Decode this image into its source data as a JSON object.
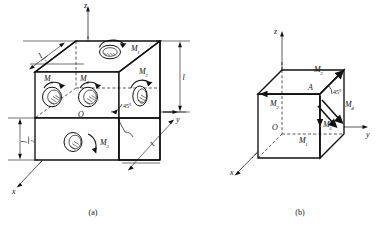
{
  "figure": {
    "panels": [
      {
        "id": "a",
        "caption": "(a)",
        "axes": {
          "x": "x",
          "y": "y",
          "z": "z",
          "origin": "O"
        },
        "angle_label": "45°",
        "dimensions": [
          {
            "name": "top-left-length",
            "text_numerator": "l",
            "text_denominator": "2"
          },
          {
            "name": "bottom-left-height",
            "text_numerator": "l",
            "text_denominator": "2"
          },
          {
            "name": "right-height",
            "text": "l"
          },
          {
            "name": "depth-length",
            "text": "l"
          }
        ],
        "moments": [
          {
            "label": "M",
            "sub": "1"
          },
          {
            "label": "M",
            "sub": "2"
          },
          {
            "label": "M",
            "sub": "3"
          },
          {
            "label": "M",
            "sub": "4"
          },
          {
            "label": "M",
            "sub": "5"
          }
        ]
      },
      {
        "id": "b",
        "caption": "(b)",
        "axes": {
          "x": "x",
          "y": "y",
          "z": "z",
          "origin": "O"
        },
        "point_label": "A",
        "angle_label": "45°",
        "moments": [
          {
            "label": "M",
            "sub": "1"
          },
          {
            "label": "M",
            "sub": "2"
          },
          {
            "label": "M",
            "sub": "3"
          },
          {
            "label": "M",
            "sub": "4"
          },
          {
            "label": "M",
            "sub": "5"
          }
        ]
      }
    ]
  },
  "colors": {
    "ink": "#111111",
    "paper": "#ffffff"
  }
}
